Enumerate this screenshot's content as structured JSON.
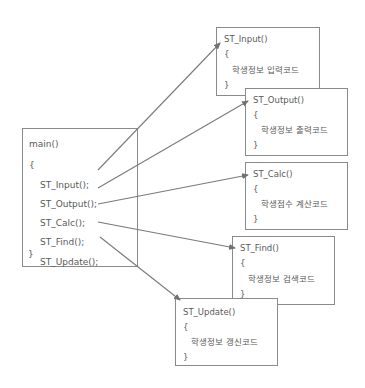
{
  "diagram": {
    "type": "function-call-structure",
    "colors": {
      "border": "#8a8a8a",
      "text": "#5a5a5a",
      "arrow": "#707070",
      "background": "#ffffff"
    },
    "main": {
      "title": "main()",
      "open_brace": "{",
      "calls": [
        "ST_Input();",
        "ST_Output();",
        "ST_Calc();",
        "ST_Find();",
        "ST_Update();"
      ],
      "close_brace": "}"
    },
    "functions": [
      {
        "name": "ST_Input()",
        "open_brace": "{",
        "body": "학생정보 입력코드",
        "close_brace": "}"
      },
      {
        "name": "ST_Output()",
        "open_brace": "{",
        "body": "학생정보 출력코드",
        "close_brace": "}"
      },
      {
        "name": "ST_Calc()",
        "open_brace": "{",
        "body": "학생점수 계산코드",
        "close_brace": "}"
      },
      {
        "name": "ST_Find()",
        "open_brace": "{",
        "body": "학생정보 검색코드",
        "close_brace": "}"
      },
      {
        "name": "ST_Update()",
        "open_brace": "{",
        "body": "학생정보 갱신코드",
        "close_brace": "}"
      }
    ],
    "edges": [
      {
        "from": "ST_Input();",
        "to": "ST_Input()"
      },
      {
        "from": "ST_Output();",
        "to": "ST_Output()"
      },
      {
        "from": "ST_Calc();",
        "to": "ST_Calc()"
      },
      {
        "from": "ST_Find();",
        "to": "ST_Find()"
      },
      {
        "from": "ST_Update();",
        "to": "ST_Update()"
      }
    ]
  }
}
